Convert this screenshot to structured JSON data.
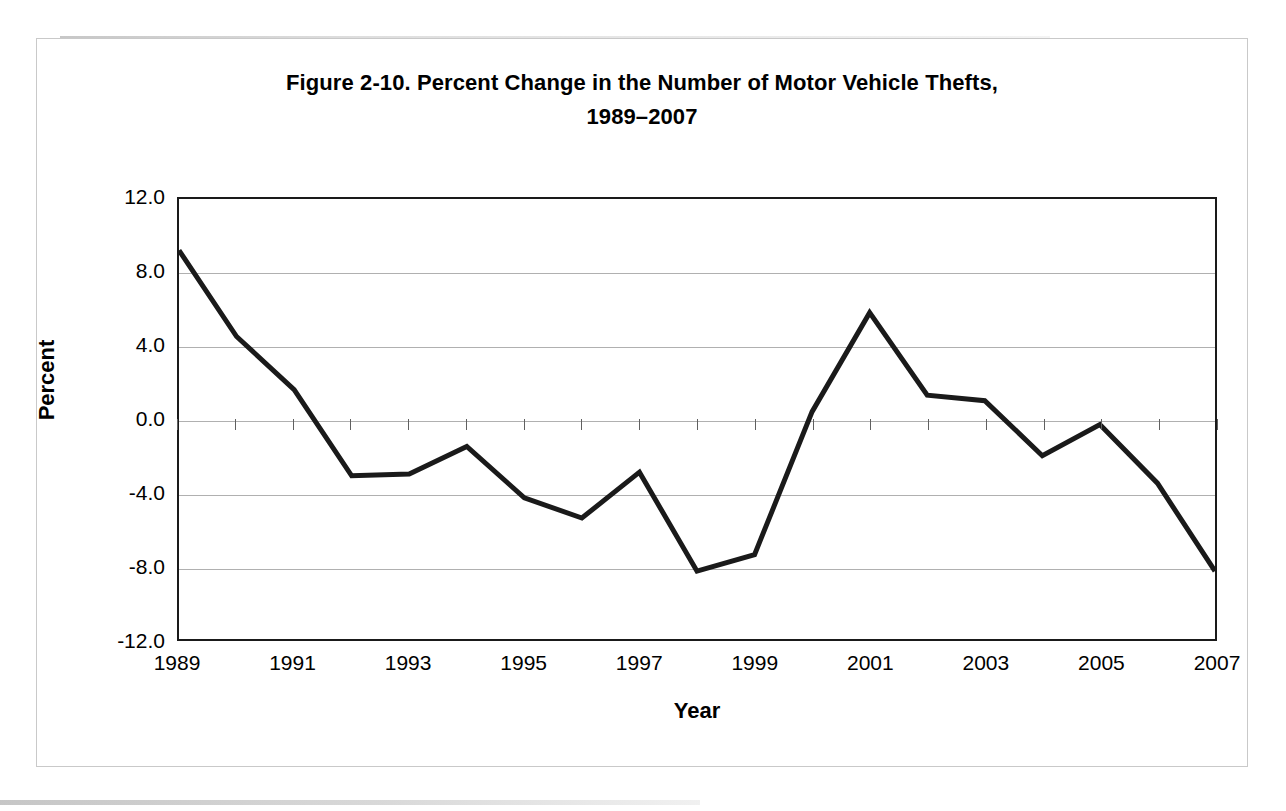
{
  "figure": {
    "title_line1": "Figure 2-10. Percent Change in the Number of Motor Vehicle Thefts,",
    "title_line2": "1989–2007",
    "frame_color": "#c9c9c9",
    "line_color": "#1a1a1a",
    "gridline_color": "#b0b0b0",
    "axis_color": "#1a1a1a",
    "background": "#ffffff"
  },
  "chart_data": {
    "type": "line",
    "title": "Figure 2-10. Percent Change in the Number of Motor Vehicle Thefts, 1989–2007",
    "xlabel": "Year",
    "ylabel": "Percent",
    "x": [
      1989,
      1990,
      1991,
      1992,
      1993,
      1994,
      1995,
      1996,
      1997,
      1998,
      1999,
      2000,
      2001,
      2002,
      2003,
      2004,
      2005,
      2006,
      2007
    ],
    "values": [
      9.2,
      4.5,
      1.6,
      -3.1,
      -3.0,
      -1.5,
      -4.3,
      -5.4,
      -2.9,
      -8.3,
      -7.4,
      0.4,
      5.8,
      1.3,
      1.0,
      -2.0,
      -0.3,
      -3.5,
      -8.3
    ],
    "series": [
      {
        "name": "Percent change in motor vehicle thefts",
        "values": [
          9.2,
          4.5,
          1.6,
          -3.1,
          -3.0,
          -1.5,
          -4.3,
          -5.4,
          -2.9,
          -8.3,
          -7.4,
          0.4,
          5.8,
          1.3,
          1.0,
          -2.0,
          -0.3,
          -3.5,
          -8.3
        ]
      }
    ],
    "xlim": [
      1989,
      2007
    ],
    "ylim": [
      -12.0,
      12.0
    ],
    "yticks": [
      12.0,
      8.0,
      4.0,
      0.0,
      -4.0,
      -8.0,
      -12.0
    ],
    "ytick_labels": [
      "12.0",
      "8.0",
      "4.0",
      "0.0",
      "-4.0",
      "-8.0",
      "-12.0"
    ],
    "xticks": [
      1989,
      1991,
      1993,
      1995,
      1997,
      1999,
      2001,
      2003,
      2005,
      2007
    ],
    "xtick_labels": [
      "1989",
      "1991",
      "1993",
      "1995",
      "1997",
      "1999",
      "2001",
      "2003",
      "2005",
      "2007"
    ],
    "grid": "horizontal",
    "legend": "none",
    "line_width": 5,
    "line_color": "#1a1a1a",
    "markers": "none"
  }
}
